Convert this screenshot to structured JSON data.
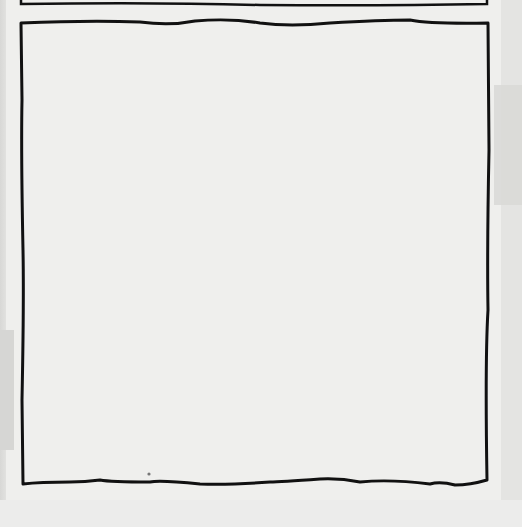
{
  "scene": {
    "description": "Photographed sheet of paper with hand-drawn comic panel borders",
    "panels": [
      {
        "name": "top-panel-bottom-edge",
        "content": ""
      },
      {
        "name": "main-panel",
        "content": ""
      }
    ],
    "colors": {
      "paper": "#efefed",
      "ink": "#111111",
      "background": "#e4e4e2"
    }
  }
}
